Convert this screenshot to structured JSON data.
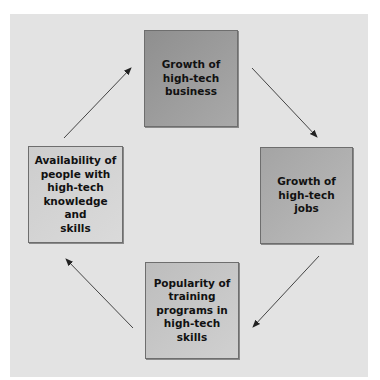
{
  "diagram": {
    "type": "cycle",
    "direction": "clockwise",
    "colors": {
      "background_panel": "#e3e3e3",
      "box_top": "#9c9c9c",
      "box_right": "#b0b0b0",
      "box_bottom": "#c6c6c6",
      "box_left": "#d3d3d3",
      "arrow": "#333333"
    },
    "nodes": [
      {
        "id": "top",
        "label": "Growth of\nhigh-tech\nbusiness"
      },
      {
        "id": "right",
        "label": "Growth of\nhigh-tech jobs"
      },
      {
        "id": "bottom",
        "label": "Popularity of\ntraining\nprograms in\nhigh-tech skills"
      },
      {
        "id": "left",
        "label": "Availability of\npeople with\nhigh-tech\nknowledge and\nskills"
      }
    ],
    "edges": [
      {
        "from": "top",
        "to": "right"
      },
      {
        "from": "right",
        "to": "bottom"
      },
      {
        "from": "bottom",
        "to": "left"
      },
      {
        "from": "left",
        "to": "top"
      }
    ]
  }
}
